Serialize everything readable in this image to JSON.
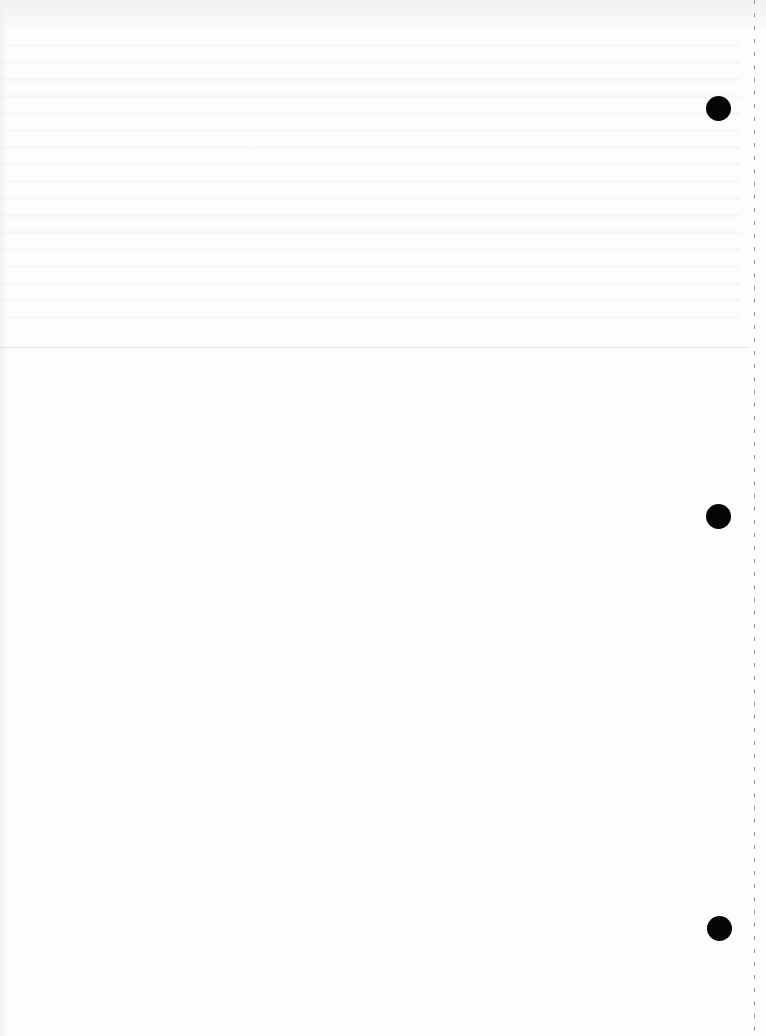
{
  "document": {
    "type": "blank scanned page",
    "text_content": "",
    "features": {
      "punch_holes": [
        {
          "position": "top",
          "cx": 718,
          "cy": 108
        },
        {
          "position": "middle",
          "cx": 718,
          "cy": 516
        },
        {
          "position": "bottom",
          "cx": 719,
          "cy": 928
        }
      ],
      "fold_line_y": 347,
      "perforation_x": 754
    },
    "colors": {
      "paper": "#fdfdfd",
      "hole": "#050505",
      "perforation": "#9a9a9a",
      "fold_line": "#e4e4e4"
    }
  }
}
